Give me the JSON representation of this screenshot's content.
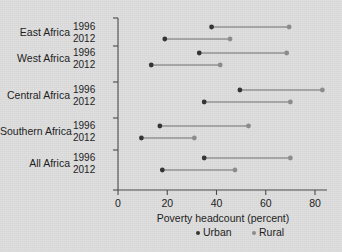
{
  "chart_data": {
    "type": "scatter",
    "subtype": "dumbbell-dot-plot",
    "title": "",
    "xlabel": "Poverty headcount (percent)",
    "ylabel": "",
    "xlim": [
      0,
      88
    ],
    "xticks": [
      0,
      20,
      40,
      60,
      80
    ],
    "xtick_labels": [
      "0",
      "20",
      "40",
      "60",
      "80"
    ],
    "grid": false,
    "legend_position": "bottom-center",
    "series": [
      {
        "name": "Urban",
        "color": "#333333"
      },
      {
        "name": "Rural",
        "color": "#8d8d8d"
      }
    ],
    "categories": [
      "East Africa",
      "West Africa",
      "Central Africa",
      "Southern Africa",
      "All Africa"
    ],
    "years": [
      "1996",
      "2012"
    ],
    "rows": [
      {
        "region": "East Africa",
        "year": "1996",
        "urban": 38.0,
        "rural": 69.5
      },
      {
        "region": "East Africa",
        "year": "2012",
        "urban": 19.0,
        "rural": 45.5
      },
      {
        "region": "West Africa",
        "year": "1996",
        "urban": 33.0,
        "rural": 68.5
      },
      {
        "region": "West Africa",
        "year": "2012",
        "urban": 13.5,
        "rural": 41.5
      },
      {
        "region": "Central Africa",
        "year": "1996",
        "urban": 49.5,
        "rural": 83.0
      },
      {
        "region": "Central Africa",
        "year": "2012",
        "urban": 35.0,
        "rural": 70.0
      },
      {
        "region": "Southern Africa",
        "year": "1996",
        "urban": 17.0,
        "rural": 53.0
      },
      {
        "region": "Southern Africa",
        "year": "2012",
        "urban": 9.5,
        "rural": 31.0
      },
      {
        "region": "All Africa",
        "year": "1996",
        "urban": 35.0,
        "rural": 70.0
      },
      {
        "region": "All Africa",
        "year": "2012",
        "urban": 18.0,
        "rural": 47.5
      }
    ]
  },
  "axis": {
    "x_title": "Poverty headcount (percent)"
  },
  "legend": {
    "items": [
      {
        "label": "Urban",
        "color": "#333333"
      },
      {
        "label": "Rural",
        "color": "#8d8d8d"
      }
    ]
  },
  "colors": {
    "background": "#dedede",
    "axis": "#4a4a4a",
    "urban": "#333333",
    "rural": "#8d8d8d",
    "text": "#1b1b1b"
  }
}
